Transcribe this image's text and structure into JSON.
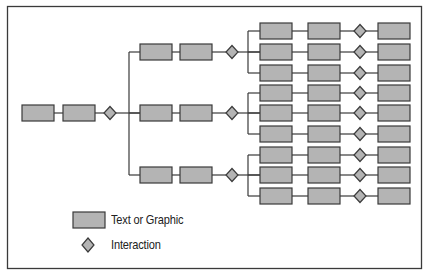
{
  "diagram": {
    "title": "",
    "colors": {
      "box_fill": "#b4b4b4",
      "box_stroke": "#3a3a3a",
      "diamond_fill": "#b4b4b4",
      "line": "#3a3a3a",
      "frame": "#3a3a3a"
    },
    "nodes": {
      "root": [
        "Text or Graphic",
        "Text or Graphic",
        "Interaction"
      ],
      "level2_branches": 3,
      "level2_each": [
        "Text or Graphic",
        "Text or Graphic",
        "Interaction"
      ],
      "level3_per_branch": 3,
      "level3_each": [
        "Text or Graphic",
        "Text or Graphic",
        "Interaction",
        "Text or Graphic"
      ]
    }
  },
  "legend": {
    "items": [
      {
        "shape": "rectangle",
        "label": "Text or Graphic"
      },
      {
        "shape": "diamond",
        "label": "Interaction"
      }
    ]
  }
}
